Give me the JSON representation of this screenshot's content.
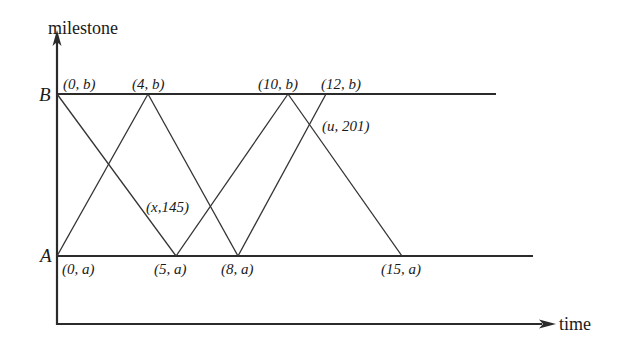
{
  "diagram": {
    "y_axis_label": "milestone",
    "x_axis_label": "time",
    "endpoints": {
      "top": "B",
      "bottom": "A"
    },
    "top_points": [
      {
        "label": "(0, b)",
        "t": 0
      },
      {
        "label": "(4, b)",
        "t": 4
      },
      {
        "label": "(10, b)",
        "t": 10
      },
      {
        "label": "(12, b)",
        "t": 12
      }
    ],
    "bottom_points": [
      {
        "label": "(0, a)",
        "t": 0
      },
      {
        "label": "(5, a)",
        "t": 5
      },
      {
        "label": "(8, a)",
        "t": 8
      },
      {
        "label": "(15, a)",
        "t": 15
      }
    ],
    "intersections": [
      {
        "label": "(x,145)"
      },
      {
        "label": "(u, 201)"
      }
    ],
    "segments": [
      {
        "from": "(0, b)",
        "to": "(5, a)"
      },
      {
        "from": "(0, a)",
        "to": "(4, b)"
      },
      {
        "from": "(4, b)",
        "to": "(8, a)"
      },
      {
        "from": "(5, a)",
        "to": "(10, b)"
      },
      {
        "from": "(8, a)",
        "to": "(12, b)"
      },
      {
        "from": "(10, b)",
        "to": "(15, a)"
      }
    ],
    "line_color": "#2b2b2b"
  }
}
